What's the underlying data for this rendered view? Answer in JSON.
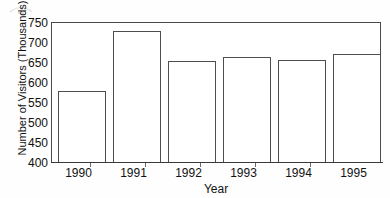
{
  "chart_data": {
    "type": "bar",
    "title": "",
    "subtitle": "",
    "xlabel": "Year",
    "ylabel": "Number of Visitors (Thousands)",
    "categories": [
      "1990",
      "1991",
      "1992",
      "1993",
      "1994",
      "1995"
    ],
    "values": [
      580,
      730,
      655,
      665,
      658,
      672
    ],
    "series": [
      {
        "name": "Number of Visitors (Thousands)",
        "values": [
          580,
          730,
          655,
          665,
          658,
          672
        ]
      }
    ],
    "ylim": [
      400,
      750
    ],
    "yticks": [
      400,
      450,
      500,
      550,
      600,
      650,
      700,
      750
    ],
    "ytick_labels": [
      "400",
      "450",
      "500",
      "550",
      "600",
      "650",
      "700",
      "750"
    ],
    "xtick_labels": [
      "1990",
      "1991",
      "1992",
      "1993",
      "1994",
      "1995"
    ],
    "grid": false,
    "legend": false,
    "legend_position": "none",
    "bar_fill_color": "#ffffff",
    "bar_edge_color": "#4d4d4d",
    "axis_color": "#4a4a4a",
    "background_color": "#ffffff",
    "text_color": "#111111"
  }
}
